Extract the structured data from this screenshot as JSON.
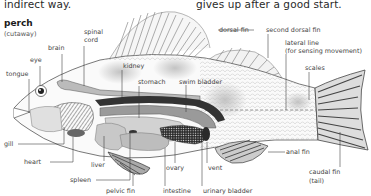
{
  "page_text": {
    "left_fragment": "indirect way.",
    "right_fragment": "gives up after a good start."
  },
  "diagram": {
    "title": "perch",
    "subtitle": "(cutaway)",
    "labels": {
      "spinal_cord_1": "spinal",
      "spinal_cord_2": "cord",
      "brain": "brain",
      "eye": "eye",
      "tongue": "tongue",
      "kidney": "kidney",
      "stomach": "stomach",
      "swim_bladder": "swim bladder",
      "dorsal_fin": "dorsal fin",
      "second_dorsal_fin": "second dorsal fin",
      "lateral_line_1": "lateral line",
      "lateral_line_2": "(for sensing movement)",
      "scales": "scales",
      "gill": "gill",
      "heart": "heart",
      "liver": "liver",
      "spleen": "spleen",
      "pelvic_fin": "pelvic fin",
      "ovary": "ovary",
      "intestine": "intestine",
      "vent": "vent",
      "urinary_bladder": "urinary bladder",
      "anal_fin": "anal fin",
      "caudal_fin_1": "caudal fin",
      "caudal_fin_2": "(tail)"
    }
  },
  "colors": {
    "body_outline": "#555555",
    "organ_light": "#d6d6d6",
    "organ_mid": "#a8a8a8",
    "organ_dark": "#3a3a3a",
    "leader_line": "#333333",
    "text": "#444444"
  }
}
